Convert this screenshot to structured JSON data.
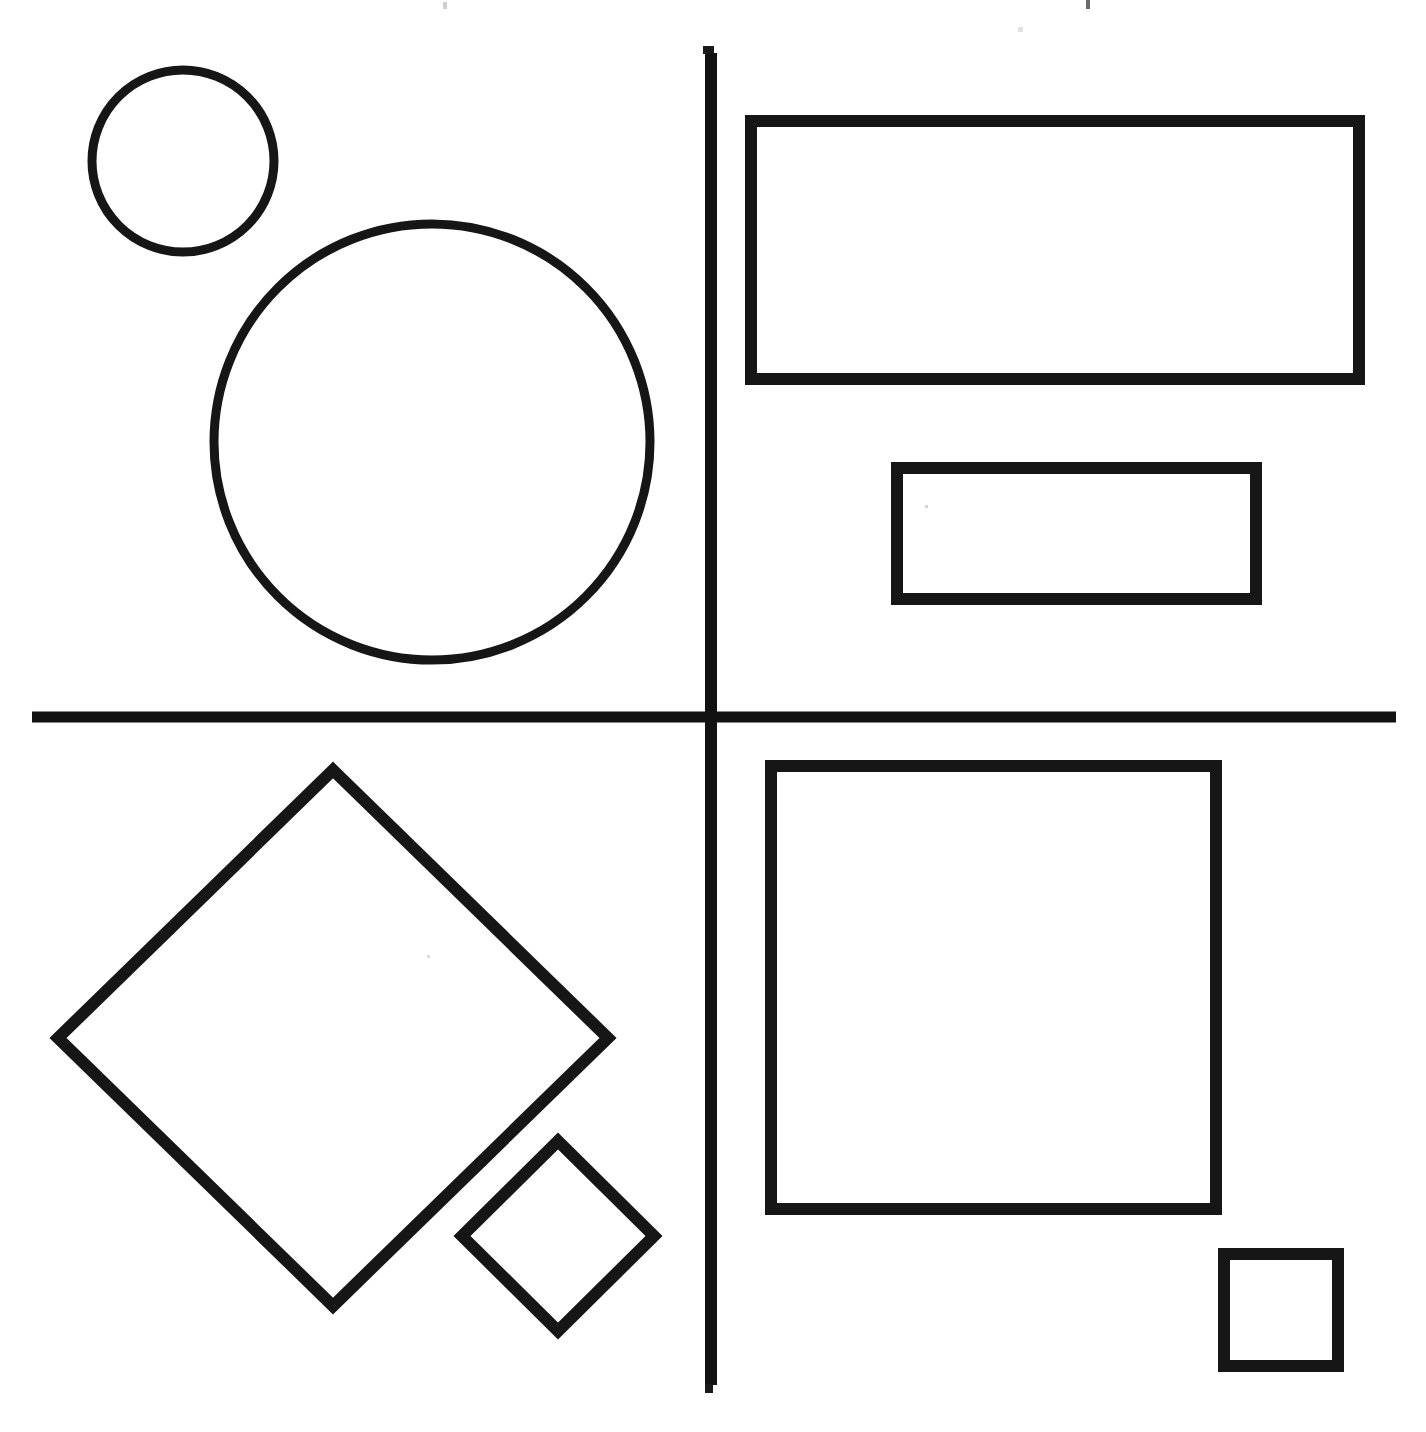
{
  "document": {
    "title": "Geometric Shapes — Four Quadrant Line Drawing",
    "media": "scanned black ink line drawing on white paper",
    "canvas": {
      "width": 1426,
      "height": 1432,
      "background": "#ffffff"
    },
    "ink_color": "#161616",
    "paper_color": "#ffffff"
  },
  "dividers": {
    "label": "quadrant dividers",
    "vertical": {
      "name": "vertical-divider",
      "x": 711,
      "y1": 53,
      "y2": 1385,
      "thickness": 12,
      "color": "#121212"
    },
    "horizontal": {
      "name": "horizontal-divider",
      "y": 717,
      "x1": 32,
      "x2": 1396,
      "thickness": 11,
      "color": "#121212"
    }
  },
  "quadrants": [
    {
      "id": "top-left",
      "label": "Top Left Quadrant",
      "shape_family": "circles",
      "count": 2,
      "shapes": [
        {
          "name": "small-circle",
          "type": "circle",
          "cx": 183,
          "cy": 161,
          "r": 91,
          "stroke_width": 9,
          "size_rank": "small"
        },
        {
          "name": "large-circle",
          "type": "circle",
          "cx": 432,
          "cy": 442,
          "r": 218,
          "stroke_width": 9,
          "size_rank": "large"
        }
      ]
    },
    {
      "id": "top-right",
      "label": "Top Right Quadrant",
      "shape_family": "rectangles",
      "count": 2,
      "shapes": [
        {
          "name": "large-rectangle",
          "type": "rect",
          "x": 751,
          "y": 121,
          "width": 608,
          "height": 258,
          "stroke_width": 12,
          "size_rank": "large"
        },
        {
          "name": "small-rectangle",
          "type": "rect",
          "x": 897,
          "y": 468,
          "width": 359,
          "height": 131,
          "stroke_width": 12,
          "size_rank": "small"
        }
      ]
    },
    {
      "id": "bottom-left",
      "label": "Bottom Left Quadrant",
      "shape_family": "diamonds",
      "count": 2,
      "shapes": [
        {
          "name": "large-diamond",
          "type": "diamond",
          "cx": 333,
          "cy": 1038,
          "rx": 275,
          "ry": 268,
          "points": "333,770 608,1038 333,1306 58,1038",
          "stroke_width": 12,
          "size_rank": "large"
        },
        {
          "name": "small-diamond",
          "type": "diamond",
          "cx": 558,
          "cy": 1236,
          "rx": 96,
          "ry": 95,
          "points": "558,1141 654,1236 558,1331 462,1236",
          "stroke_width": 12,
          "size_rank": "small"
        }
      ]
    },
    {
      "id": "bottom-right",
      "label": "Bottom Right Quadrant",
      "shape_family": "squares",
      "count": 2,
      "shapes": [
        {
          "name": "large-square",
          "type": "square",
          "x": 771,
          "y": 766,
          "width": 445,
          "height": 443,
          "stroke_width": 12,
          "size_rank": "large"
        },
        {
          "name": "small-square",
          "type": "square",
          "x": 1224,
          "y": 1254,
          "width": 114,
          "height": 112,
          "stroke_width": 12,
          "size_rank": "small"
        }
      ]
    }
  ],
  "scan_artifacts": [
    {
      "name": "speck-top-left",
      "x": 443,
      "y": 2,
      "w": 4,
      "h": 7,
      "shade": "#cfcfcf"
    },
    {
      "name": "speck-top-right",
      "x": 1086,
      "y": 0,
      "w": 4,
      "h": 9,
      "shade": "#6a6a6a"
    },
    {
      "name": "speck-top-center",
      "x": 703,
      "y": 46,
      "w": 11,
      "h": 8,
      "shade": "#1a1a1a"
    },
    {
      "name": "speck-upper-right",
      "x": 1018,
      "y": 27,
      "w": 5,
      "h": 5,
      "shade": "#e0e0e0"
    },
    {
      "name": "speck-rect-interior",
      "x": 925,
      "y": 505,
      "w": 3,
      "h": 3,
      "shade": "#d5d5d5"
    },
    {
      "name": "speck-diamond-interior",
      "x": 427,
      "y": 955,
      "w": 3,
      "h": 3,
      "shade": "#dcdcdc"
    },
    {
      "name": "speck-bottom-center",
      "x": 705,
      "y": 1384,
      "w": 8,
      "h": 9,
      "shade": "#1a1a1a"
    }
  ]
}
